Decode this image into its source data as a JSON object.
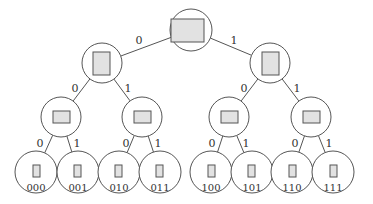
{
  "diagram": {
    "type": "binary-tree",
    "colors": {
      "stroke": "#555555",
      "node_fill": "#ffffff",
      "rect_fill": "#e2e2e2",
      "text": "#333333"
    },
    "nodes": [
      {
        "id": "root",
        "cx": 191,
        "cy": 30,
        "r": 21,
        "rect": {
          "x": 171,
          "y": 19,
          "w": 33,
          "h": 23
        }
      },
      {
        "id": "0",
        "cx": 102,
        "cy": 63,
        "r": 20,
        "rect": {
          "x": 93,
          "y": 52,
          "w": 17,
          "h": 23
        }
      },
      {
        "id": "1",
        "cx": 270,
        "cy": 63,
        "r": 20,
        "rect": {
          "x": 262,
          "y": 52,
          "w": 17,
          "h": 23
        }
      },
      {
        "id": "00",
        "cx": 61,
        "cy": 117,
        "r": 20,
        "rect": {
          "x": 53,
          "y": 111,
          "w": 17,
          "h": 12
        }
      },
      {
        "id": "01",
        "cx": 142,
        "cy": 117,
        "r": 20,
        "rect": {
          "x": 134,
          "y": 111,
          "w": 17,
          "h": 12
        }
      },
      {
        "id": "10",
        "cx": 229,
        "cy": 117,
        "r": 20,
        "rect": {
          "x": 221,
          "y": 111,
          "w": 17,
          "h": 12
        }
      },
      {
        "id": "11",
        "cx": 311,
        "cy": 117,
        "r": 20,
        "rect": {
          "x": 303,
          "y": 111,
          "w": 17,
          "h": 12
        }
      },
      {
        "id": "000",
        "cx": 36,
        "cy": 172,
        "r": 21,
        "rect": {
          "x": 33,
          "y": 165,
          "w": 7,
          "h": 12
        },
        "label": "000"
      },
      {
        "id": "001",
        "cx": 78,
        "cy": 172,
        "r": 21,
        "rect": {
          "x": 74,
          "y": 165,
          "w": 7,
          "h": 12
        },
        "label": "001"
      },
      {
        "id": "010",
        "cx": 119,
        "cy": 172,
        "r": 21,
        "rect": {
          "x": 115,
          "y": 165,
          "w": 7,
          "h": 12
        },
        "label": "010"
      },
      {
        "id": "011",
        "cx": 160,
        "cy": 172,
        "r": 21,
        "rect": {
          "x": 156,
          "y": 165,
          "w": 7,
          "h": 12
        },
        "label": "011"
      },
      {
        "id": "100",
        "cx": 211,
        "cy": 172,
        "r": 21,
        "rect": {
          "x": 208,
          "y": 165,
          "w": 7,
          "h": 12
        },
        "label": "100"
      },
      {
        "id": "101",
        "cx": 252,
        "cy": 172,
        "r": 21,
        "rect": {
          "x": 248,
          "y": 165,
          "w": 7,
          "h": 12
        },
        "label": "101"
      },
      {
        "id": "110",
        "cx": 292,
        "cy": 172,
        "r": 21,
        "rect": {
          "x": 289,
          "y": 165,
          "w": 7,
          "h": 12
        },
        "label": "110"
      },
      {
        "id": "111",
        "cx": 333,
        "cy": 172,
        "r": 21,
        "rect": {
          "x": 330,
          "y": 165,
          "w": 7,
          "h": 12
        },
        "label": "111"
      }
    ],
    "edges": [
      {
        "from": "root",
        "to": "0",
        "label": "0",
        "lx": 139,
        "ly": 44
      },
      {
        "from": "root",
        "to": "1",
        "label": "1",
        "lx": 234,
        "ly": 44
      },
      {
        "from": "0",
        "to": "00",
        "label": "0",
        "lx": 75,
        "ly": 92
      },
      {
        "from": "0",
        "to": "01",
        "label": "1",
        "lx": 128,
        "ly": 92
      },
      {
        "from": "1",
        "to": "10",
        "label": "0",
        "lx": 244,
        "ly": 92
      },
      {
        "from": "1",
        "to": "11",
        "label": "1",
        "lx": 297,
        "ly": 92
      },
      {
        "from": "00",
        "to": "000",
        "label": "0",
        "lx": 40,
        "ly": 147
      },
      {
        "from": "00",
        "to": "001",
        "label": "1",
        "lx": 77,
        "ly": 147
      },
      {
        "from": "01",
        "to": "010",
        "label": "0",
        "lx": 126,
        "ly": 147
      },
      {
        "from": "01",
        "to": "011",
        "label": "1",
        "lx": 158,
        "ly": 147
      },
      {
        "from": "10",
        "to": "100",
        "label": "0",
        "lx": 212,
        "ly": 147
      },
      {
        "from": "10",
        "to": "101",
        "label": "1",
        "lx": 246,
        "ly": 147
      },
      {
        "from": "11",
        "to": "110",
        "label": "0",
        "lx": 295,
        "ly": 147
      },
      {
        "from": "11",
        "to": "111",
        "label": "1",
        "lx": 329,
        "ly": 147
      }
    ]
  }
}
